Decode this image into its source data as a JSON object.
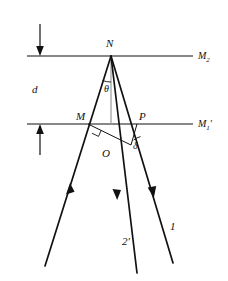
{
  "figure": {
    "background_color": "#ffffff",
    "line_color": "#111111",
    "normal_color": "#9a9a9a",
    "width": 228,
    "height": 281
  },
  "labels": {
    "apex_point": "N",
    "left_surface_point": "M",
    "right_surface_point": "P",
    "foot_point": "O",
    "top_surface": "M",
    "top_surface_sub": "2",
    "bottom_surface": "M",
    "bottom_surface_sub": "1",
    "bottom_surface_prime": "′",
    "thickness": "d",
    "angle_theta": "θ",
    "angle_delta": "δ",
    "ray_one": "1",
    "ray_two_prime": "2′"
  },
  "geometry": {
    "top_surface_y": 56,
    "bottom_surface_y": 124,
    "surface_x_start": 27,
    "surface_x_end": 193,
    "point_N": [
      111,
      56
    ],
    "point_M": [
      88,
      124
    ],
    "point_P": [
      137,
      124
    ],
    "point_O": [
      128,
      143
    ],
    "normal_from": [
      111,
      56
    ],
    "normal_to": [
      111,
      124
    ],
    "incident_ray_start": [
      45,
      266
    ],
    "reflected_ray_2_end": [
      137,
      273
    ],
    "reflected_ray_1_end": [
      173,
      263
    ],
    "dimension_arrow_x": 40,
    "theta_arc_radius": 26,
    "delta_arc_radius": 17
  },
  "annotations": {
    "incident_arrow_direction": "up-right",
    "ray_2_arrow_direction": "down-right",
    "ray_1_arrow_direction": "down-right",
    "thickness_top_arrow_direction": "down",
    "thickness_bottom_arrow_direction": "up",
    "right_angle_at": "M"
  }
}
